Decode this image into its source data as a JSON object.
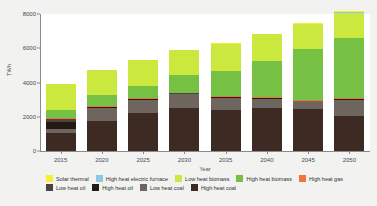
{
  "chart_data": {
    "type": "bar",
    "stacked": true,
    "title": "",
    "xlabel": "Year",
    "ylabel": "TWh",
    "ylim": [
      0,
      8000
    ],
    "yticks": [
      "0",
      "2000",
      "4000",
      "6000",
      "8000"
    ],
    "ytick_values": [
      0,
      2000,
      4000,
      6000,
      8000
    ],
    "grid": false,
    "legend_position": "bottom",
    "categories": [
      "2015",
      "2020",
      "2025",
      "2030",
      "2035",
      "2040",
      "2045",
      "2050"
    ],
    "series": [
      {
        "name": "High heat coal",
        "color": "#3d2b23",
        "values": [
          1050,
          1750,
          2200,
          2520,
          2400,
          2500,
          2480,
          2060
        ]
      },
      {
        "name": "Low heat coal",
        "color": "#6e655f",
        "values": [
          230,
          780,
          790,
          790,
          700,
          560,
          420,
          940
        ]
      },
      {
        "name": "High heat oil",
        "color": "#231a15",
        "values": [
          420,
          40,
          30,
          30,
          30,
          20,
          20,
          20
        ]
      },
      {
        "name": "Low heat oil",
        "color": "#4a433e",
        "values": [
          170,
          30,
          30,
          30,
          30,
          20,
          20,
          20
        ]
      },
      {
        "name": "High heat gas",
        "color": "#f2733f",
        "values": [
          50,
          40,
          40,
          40,
          40,
          40,
          50,
          60
        ]
      },
      {
        "name": "High heat biomass",
        "color": "#76c043",
        "values": [
          460,
          650,
          730,
          1010,
          1490,
          2100,
          2960,
          3490
        ]
      },
      {
        "name": "Low heat biomass",
        "color": "#cbe83e",
        "values": [
          1510,
          1420,
          1490,
          1460,
          1580,
          1590,
          1450,
          1490
        ]
      },
      {
        "name": "High heat electric furnace",
        "color": "#8fc6e0",
        "values": [
          10,
          10,
          10,
          10,
          10,
          10,
          15,
          20
        ]
      },
      {
        "name": "Solar thermal",
        "color": "#f7ef36",
        "values": [
          10,
          10,
          10,
          10,
          20,
          20,
          40,
          60
        ]
      }
    ],
    "totals": [
      3910,
      4730,
      5330,
      5900,
      6300,
      6860,
      7455,
      8160
    ],
    "legend_rows": [
      [
        {
          "label": "Solar thermal",
          "color": "#f7ef36"
        },
        {
          "label": "High heat electric furnace",
          "color": "#8fc6e0"
        },
        {
          "label": "Low heat biomass",
          "color": "#cbe83e"
        },
        {
          "label": "High heat biomass",
          "color": "#76c043"
        },
        {
          "label": "High heat gas",
          "color": "#f2733f"
        }
      ],
      [
        {
          "label": "Low heat oil",
          "color": "#4a433e"
        },
        {
          "label": "High heat oil",
          "color": "#231a15"
        },
        {
          "label": "Low heat coal",
          "color": "#6e655f"
        },
        {
          "label": "High heat coal",
          "color": "#3d2b23"
        }
      ]
    ]
  }
}
